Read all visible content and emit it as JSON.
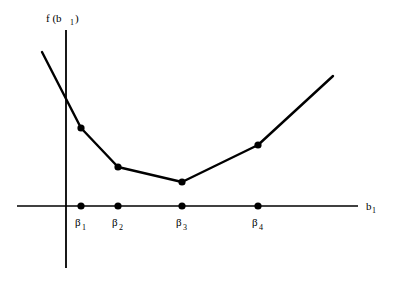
{
  "figure": {
    "background_color": "#ffffff",
    "line_color": "#000000",
    "axis_color": "#000000",
    "marker_color": "#000000"
  },
  "chart_data": {
    "type": "line",
    "title": "",
    "xlabel": "b_1",
    "ylabel": "f(b_1)",
    "xlabel_base": "b",
    "xlabel_subscript": "1",
    "ylabel_base": "f (b",
    "ylabel_subscript": "1",
    "ylabel_close": ")",
    "grid": false,
    "legend": "none",
    "categories": [
      "β",
      "β",
      "β",
      "β"
    ],
    "tick_labels": [
      {
        "base": "β",
        "subscript": "1",
        "x": 81
      },
      {
        "base": "β",
        "subscript": "2",
        "x": 118
      },
      {
        "base": "β",
        "subscript": "3",
        "x": 182
      },
      {
        "base": "β",
        "subscript": "4",
        "x": 258
      }
    ],
    "x": [
      81,
      118,
      182,
      258
    ],
    "values": [
      78,
      39,
      24,
      61
    ],
    "ylim": [
      0,
      130
    ],
    "xlim": [
      17,
      358
    ],
    "axis_origin": {
      "x": 66,
      "y": 206
    },
    "curve_points_px": [
      {
        "x": 42,
        "y": 52
      },
      {
        "x": 81,
        "y": 128
      },
      {
        "x": 118,
        "y": 167
      },
      {
        "x": 182,
        "y": 182
      },
      {
        "x": 258,
        "y": 145
      },
      {
        "x": 333,
        "y": 76
      }
    ],
    "marker_points_px": [
      {
        "x": 81,
        "y": 128
      },
      {
        "x": 118,
        "y": 167
      },
      {
        "x": 182,
        "y": 182
      },
      {
        "x": 258,
        "y": 145
      }
    ],
    "axis_markers_px": [
      {
        "x": 81,
        "y": 206
      },
      {
        "x": 118,
        "y": 206
      },
      {
        "x": 182,
        "y": 206
      },
      {
        "x": 258,
        "y": 206
      }
    ],
    "x_axis_px": {
      "x1": 17,
      "y1": 206,
      "x2": 358,
      "y2": 206
    },
    "y_axis_px": {
      "x1": 66,
      "y1": 30,
      "x2": 66,
      "y2": 268
    },
    "ylabel_pos_px": {
      "x": 46,
      "y": 22
    },
    "xlabel_pos_px": {
      "x": 366,
      "y": 210
    }
  }
}
